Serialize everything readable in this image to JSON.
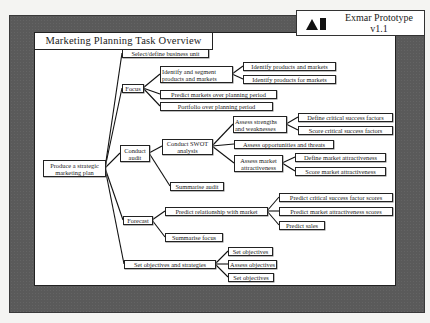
{
  "header": {
    "title": "Marketing Planning Task Overview",
    "product_name": "Exmar Prototype",
    "product_version": "v1.1",
    "logo_icon": "triangle-and-bar-logo"
  },
  "tree": {
    "root": "Produce a strategic marketing plan",
    "level1": {
      "select": "Select/define business unit",
      "focus": "Focus",
      "audit": "Conduct audit",
      "forecast": "Forecast",
      "objectives": "Set objectives and strategies"
    },
    "focus_children": {
      "identify_segment": "Identify and segment products and markets",
      "predict_markets": "Predict markets over planning period",
      "portfolio": "Portfolio over planning period",
      "identify_products_markets": "Identify products and markets",
      "identify_products_for_markets": "Identify products for markets"
    },
    "audit_children": {
      "swot": "Conduct SWOT analysis",
      "summarise_audit": "Summarise audit",
      "assess_strengths": "Assess strengths and weaknesses",
      "assess_opportunities": "Assess opportunities and threats",
      "assess_market": "Assess market attractiveness",
      "define_csf": "Define critical success factors",
      "score_csf": "Score critical success factors",
      "define_market": "Define market attractiveness",
      "score_market": "Score market attractiveness"
    },
    "forecast_children": {
      "predict_relationship": "Predict relationship with market",
      "summarise_focus": "Summarise focus",
      "predict_csf_scores": "Predict critical success factor scores",
      "predict_market_scores": "Predict market attractiveness scores",
      "predict_sales": "Predict sales"
    },
    "objectives_children": {
      "set_objectives_1": "Set objectives",
      "assess_objectives": "Assess objectives",
      "set_objectives_2": "Set objectives"
    }
  },
  "colors": {
    "frame": "#5a5a5a",
    "panel": "#ffffff",
    "line": "#222222"
  }
}
